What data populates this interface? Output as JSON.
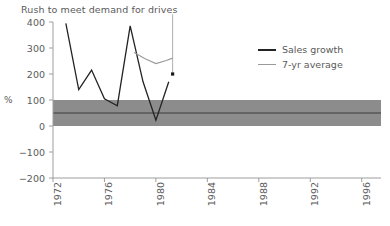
{
  "chart_data": {
    "type": "line",
    "title": "Rush to meet demand for drives",
    "xlabel": "",
    "ylabel": "%",
    "xlim": [
      1972,
      1997.5
    ],
    "ylim": [
      -200,
      400
    ],
    "grid": false,
    "legend_position": "top-right",
    "y_ticks": [
      400,
      300,
      200,
      100,
      0,
      -100,
      -200
    ],
    "y_tick_labels": [
      "400",
      "300",
      "200",
      "100",
      "0",
      "−100",
      "−200"
    ],
    "x_ticks": [
      1972,
      1976,
      1980,
      1984,
      1988,
      1992,
      1996
    ],
    "x_tick_labels": [
      "1972",
      "1976",
      "1980",
      "1984",
      "1988",
      "1992",
      "1996"
    ],
    "series": [
      {
        "name": "Sales growth",
        "color": "#232323",
        "x": [
          1973,
          1974,
          1975,
          1976,
          1977,
          1978,
          1979,
          1980,
          1981
        ],
        "values": [
          395,
          140,
          215,
          105,
          78,
          385,
          170,
          22,
          170
        ]
      },
      {
        "name": "7-yr average",
        "color": "#9a9a9a",
        "x": [
          1978.3,
          1979.2,
          1980.0,
          1980.8,
          1981.3
        ],
        "values": [
          283,
          258,
          240,
          252,
          261
        ]
      }
    ],
    "band": {
      "name": "reference-band",
      "y_from": 0,
      "y_to": 100,
      "mid_line": 50,
      "fill": "#8c8c8c",
      "mid_line_color": "#3a3a3a"
    },
    "marker": {
      "name": "forecast-marker",
      "x": 1981.3,
      "value": 200,
      "color": "#1a1a1a",
      "rule_top": 430,
      "rule_bottom": 195,
      "rule_color": "#b0b0b0"
    }
  },
  "legend": {
    "items": [
      {
        "label": "Sales growth",
        "color": "#232323",
        "width": "2px"
      },
      {
        "label": "7-yr average",
        "color": "#9a9a9a",
        "width": "1.4px"
      }
    ]
  },
  "axes": {
    "axis_color": "#9d9d9d",
    "text_color": "#5a5a5a"
  }
}
